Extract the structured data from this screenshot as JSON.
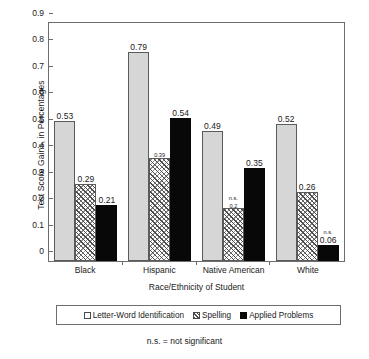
{
  "chart_data": {
    "type": "bar",
    "title": "",
    "xlabel": "Race/Ethnicity of Student",
    "ylabel": "Test Score Gains, in Percentages",
    "categories": [
      "Black",
      "Hispanic",
      "Native American",
      "White"
    ],
    "ylim": [
      0,
      0.9
    ],
    "yticks": [
      "0",
      "0.1",
      "0.2",
      "0.3",
      "0.4",
      "0.5",
      "0.6",
      "0.7",
      "0.8",
      "0.9"
    ],
    "ytick_values": [
      0,
      0.1,
      0.2,
      0.3,
      0.4,
      0.5,
      0.6,
      0.7,
      0.8,
      0.9
    ],
    "grid": false,
    "legend_position": "below-axis",
    "series": [
      {
        "name": "Letter-Word Identification",
        "key": "letter",
        "values": [
          0.53,
          0.79,
          0.49,
          0.52
        ],
        "labels": [
          "0.53",
          "0.79",
          "0.49",
          "0.52"
        ],
        "significance": [
          "",
          "",
          "",
          ""
        ]
      },
      {
        "name": "Spelling",
        "key": "spelling",
        "values": [
          0.29,
          0.39,
          0.2,
          0.26
        ],
        "labels": [
          "0.29",
          "0.39",
          "0.2",
          "0.26"
        ],
        "significance": [
          "",
          "",
          "n.s.",
          ""
        ]
      },
      {
        "name": "Applied Problems",
        "key": "applied",
        "values": [
          0.21,
          0.54,
          0.35,
          0.06
        ],
        "labels": [
          "0.21",
          "0.54",
          "0.35",
          "0.06"
        ],
        "significance": [
          "",
          "",
          "",
          "n.s."
        ]
      }
    ],
    "annotations": [
      "n.s. = not significant"
    ]
  },
  "footnote": "n.s. = not significant",
  "legend": {
    "items": [
      {
        "label": "Letter-Word Identification",
        "swatch": "open-square-swatch"
      },
      {
        "label": "Spelling",
        "swatch": "hatched-square-swatch"
      },
      {
        "label": "Applied Problems",
        "swatch": "filled-square-swatch"
      }
    ]
  }
}
